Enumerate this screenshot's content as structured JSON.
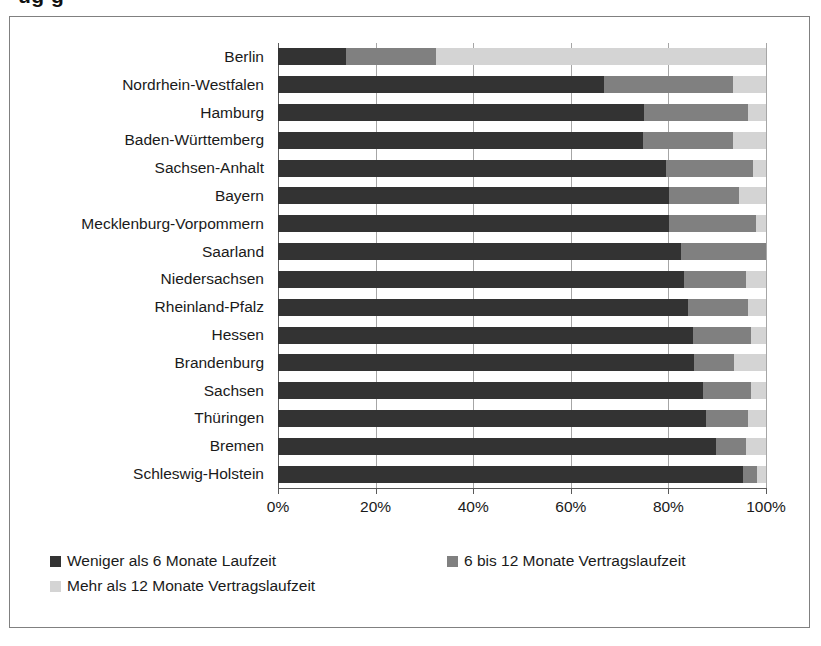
{
  "page": {
    "top_clipped_text": "ug   g"
  },
  "legend": {
    "position": "bottom",
    "entries": [
      {
        "label": "Weniger als 6 Monate Laufzeit",
        "color": "#333333"
      },
      {
        "label": "6 bis 12 Monate Vertragslaufzeit",
        "color": "#808080"
      },
      {
        "label": "Mehr als 12 Monate Vertragslaufzeit",
        "color": "#d4d4d4"
      }
    ]
  },
  "axis": {
    "x_ticks": [
      "0%",
      "20%",
      "40%",
      "60%",
      "80%",
      "100%"
    ]
  },
  "chart_data": {
    "type": "bar",
    "orientation": "horizontal",
    "stacked": true,
    "stack_mode": "percent",
    "title": "",
    "subtitle": "",
    "xlabel": "",
    "ylabel": "",
    "xlim": [
      0,
      100
    ],
    "xtick_labels": [
      "0%",
      "20%",
      "40%",
      "60%",
      "80%",
      "100%"
    ],
    "xtick_values": [
      0,
      20,
      40,
      60,
      80,
      100
    ],
    "grid": true,
    "legend_position": "bottom",
    "categories": [
      "Berlin",
      "Nordrhein-Westfalen",
      "Hamburg",
      "Baden-Württemberg",
      "Sachsen-Anhalt",
      "Bayern",
      "Mecklenburg-Vorpommern",
      "Saarland",
      "Niedersachsen",
      "Rheinland-Pfalz",
      "Hessen",
      "Brandenburg",
      "Sachsen",
      "Thüringen",
      "Bremen",
      "Schleswig-Holstein"
    ],
    "series": [
      {
        "name": "Weniger als 6 Monate Laufzeit",
        "color": "#333333",
        "values": [
          13.9,
          66.8,
          75.0,
          74.8,
          79.5,
          80.1,
          80.1,
          82.6,
          83.2,
          84.0,
          85.0,
          85.3,
          87.1,
          87.7,
          89.8,
          95.3
        ]
      },
      {
        "name": "6 bis 12 Monate Vertragslaufzeit",
        "color": "#808080",
        "values": [
          18.5,
          26.4,
          21.3,
          18.4,
          17.8,
          14.4,
          17.9,
          17.4,
          12.7,
          12.3,
          11.9,
          8.1,
          9.8,
          8.6,
          6.1,
          2.9
        ]
      },
      {
        "name": "Mehr als 12 Monate Vertragslaufzeit",
        "color": "#d4d4d4",
        "values": [
          67.6,
          6.8,
          3.7,
          6.8,
          2.7,
          5.5,
          2.0,
          0.0,
          4.1,
          3.7,
          3.1,
          6.6,
          3.1,
          3.7,
          4.1,
          1.8
        ]
      }
    ]
  }
}
